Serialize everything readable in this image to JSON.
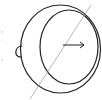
{
  "diagram": {
    "colors": {
      "stroke": "#222222",
      "axis": "#9a9a9a",
      "background": "#ffffff"
    },
    "outer_circle": {
      "cx": 60.5,
      "cy": 49,
      "rx": 40.5,
      "ry": 44
    },
    "inner_circle": {
      "cx": 69,
      "cy": 47,
      "rx": 29,
      "ry": 37
    },
    "handle": {
      "x": 19,
      "y": 46,
      "width": 8,
      "height": 11
    },
    "axis_line": {
      "x1": 30,
      "y1": 99,
      "x2": 91,
      "y2": 5
    },
    "arrow": {
      "x1": 63,
      "y1": 45,
      "x2": 84,
      "y2": 45,
      "direction": "right"
    },
    "edge_marks": [
      {
        "x": 2,
        "y": 32
      },
      {
        "x": 3,
        "y": 40
      },
      {
        "x": 2,
        "y": 60
      }
    ]
  }
}
